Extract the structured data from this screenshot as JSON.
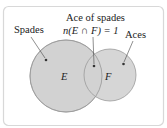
{
  "diagram": {
    "type": "venn",
    "frame_color": "#d8d8d8",
    "circle_fill": "#d2d2d2",
    "circle_stroke": "#9a9a9a",
    "sets": [
      {
        "id": "E",
        "label": "E",
        "callout": "Spades"
      },
      {
        "id": "F",
        "label": "F",
        "callout": "Aces"
      }
    ],
    "intersection": {
      "callout_line1": "Ace of spades",
      "callout_line2": "n(E ∩ F) = 1"
    }
  }
}
